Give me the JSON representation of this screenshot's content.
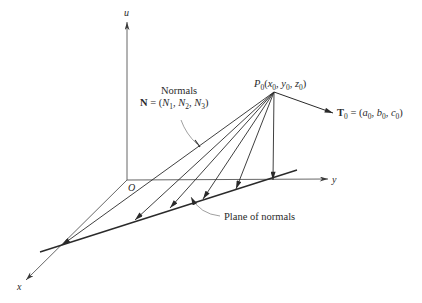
{
  "diagram": {
    "axes": {
      "u_label": "u",
      "y_label": "y",
      "x_label": "x",
      "origin_label": "O"
    },
    "point": {
      "name": "P",
      "sub": "0",
      "coords_open": "(",
      "x": "x",
      "x_sub": "0",
      "y": "y",
      "y_sub": "0",
      "z": "z",
      "z_sub": "0",
      "coords_close": ")"
    },
    "tangent": {
      "name": "T",
      "sub": "0",
      "eq": " = (",
      "a": "a",
      "a_sub": "0",
      "b": "b",
      "b_sub": "0",
      "c": "c",
      "c_sub": "0",
      "close": ")"
    },
    "normals": {
      "title": "Normals",
      "name": "N",
      "eq": " = (",
      "n": "N",
      "n1_sub": "1",
      "n2_sub": "2",
      "n3_sub": "3",
      "close": ")"
    },
    "plane_label": "Plane of normals",
    "colors": {
      "line": "#3a3a3a",
      "text": "#2a2a2a",
      "background": "#ffffff"
    }
  }
}
